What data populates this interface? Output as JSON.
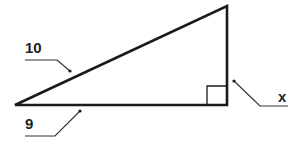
{
  "diagram": {
    "type": "right-triangle",
    "labels": {
      "hypotenuse": "10",
      "base": "9",
      "height": "x"
    },
    "colors": {
      "stroke": "#1a1a1a",
      "leader": "#333333",
      "background": "#ffffff"
    },
    "right_angle_marker": true
  }
}
